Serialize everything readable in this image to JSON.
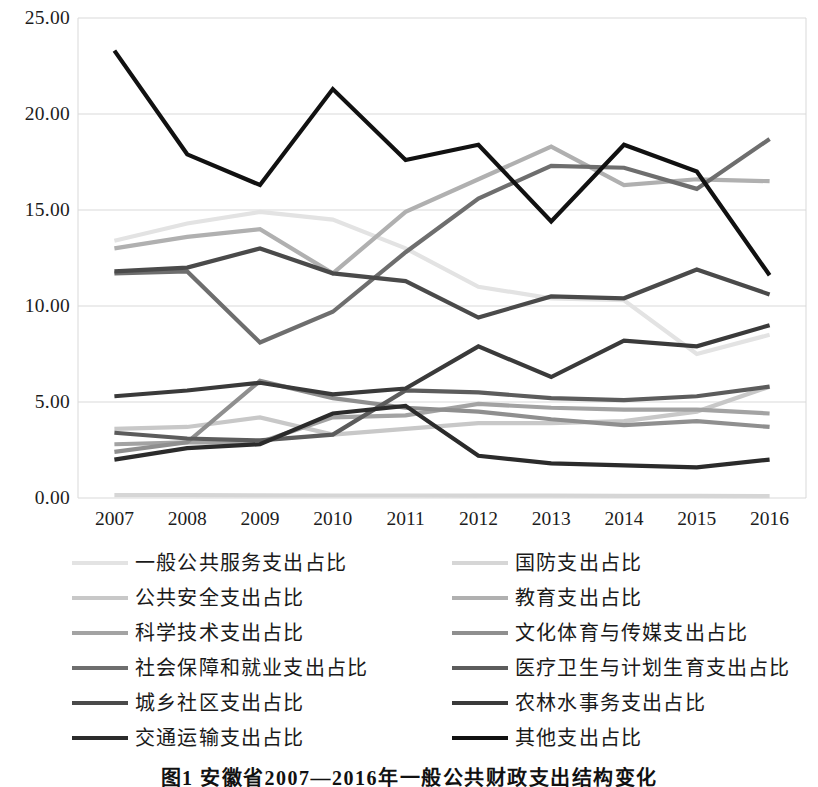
{
  "chart_data": {
    "type": "line",
    "title": "",
    "xlabel": "",
    "ylabel": "",
    "ylim": [
      0,
      25
    ],
    "ytick_labels": [
      "0.00",
      "5.00",
      "10.00",
      "15.00",
      "20.00",
      "25.00"
    ],
    "ytick_values": [
      0,
      5,
      10,
      15,
      20,
      25
    ],
    "grid": true,
    "legend_position": "bottom",
    "categories": [
      "2007",
      "2008",
      "2009",
      "2010",
      "2011",
      "2012",
      "2013",
      "2014",
      "2015",
      "2016"
    ],
    "series": [
      {
        "name": "一般公共服务支出占比",
        "color": "#e3e3e3",
        "values": [
          13.4,
          14.3,
          14.9,
          14.5,
          13.0,
          11.0,
          10.4,
          10.3,
          7.5,
          8.5
        ]
      },
      {
        "name": "国防支出占比",
        "color": "#d6d6d6",
        "values": [
          0.15,
          0.15,
          0.14,
          0.13,
          0.13,
          0.12,
          0.12,
          0.11,
          0.11,
          0.1
        ]
      },
      {
        "name": "公共安全支出占比",
        "color": "#c8c8c8",
        "values": [
          3.6,
          3.7,
          4.2,
          3.3,
          3.6,
          3.9,
          3.9,
          4.0,
          4.5,
          5.8
        ]
      },
      {
        "name": "教育支出占比",
        "color": "#b0b0b0",
        "values": [
          13.0,
          13.6,
          14.0,
          11.7,
          14.9,
          16.6,
          18.3,
          16.3,
          16.6,
          16.5
        ]
      },
      {
        "name": "科学技术支出占比",
        "color": "#a3a3a3",
        "values": [
          2.8,
          2.9,
          2.9,
          4.2,
          4.3,
          4.9,
          4.7,
          4.6,
          4.6,
          4.4
        ]
      },
      {
        "name": "文化体育与传媒支出占比",
        "color": "#8f8f8f",
        "values": [
          2.4,
          2.9,
          6.1,
          5.2,
          4.7,
          4.5,
          4.1,
          3.8,
          4.0,
          3.7
        ]
      },
      {
        "name": "社会保障和就业支出占比",
        "color": "#6e6e6e",
        "values": [
          11.7,
          11.8,
          8.1,
          9.7,
          12.8,
          15.6,
          17.3,
          17.2,
          16.1,
          18.7
        ]
      },
      {
        "name": "医疗卫生与计划生育支出占比",
        "color": "#5c5c5c",
        "values": [
          3.4,
          3.1,
          3.0,
          3.3,
          5.6,
          5.5,
          5.2,
          5.1,
          5.3,
          5.8
        ]
      },
      {
        "name": "城乡社区支出占比",
        "color": "#4a4a4a",
        "values": [
          11.8,
          12.0,
          13.0,
          11.7,
          11.3,
          9.4,
          10.5,
          10.4,
          11.9,
          10.6
        ]
      },
      {
        "name": "农林水事务支出占比",
        "color": "#3a3a3a",
        "values": [
          5.3,
          5.6,
          6.0,
          5.4,
          5.7,
          7.9,
          6.3,
          8.2,
          7.9,
          9.0
        ]
      },
      {
        "name": "交通运输支出占比",
        "color": "#2b2b2b",
        "values": [
          2.0,
          2.6,
          2.8,
          4.4,
          4.8,
          2.2,
          1.8,
          1.7,
          1.6,
          2.0
        ]
      },
      {
        "name": "其他支出占比",
        "color": "#111111",
        "values": [
          23.3,
          17.9,
          16.3,
          21.3,
          17.6,
          18.4,
          14.4,
          18.4,
          17.0,
          11.6
        ]
      }
    ]
  },
  "legend": {
    "left_column": [
      "一般公共服务支出占比",
      "公共安全支出占比",
      "科学技术支出占比",
      "社会保障和就业支出占比",
      "城乡社区支出占比",
      "交通运输支出占比"
    ],
    "right_column": [
      "国防支出占比",
      "教育支出占比",
      "文化体育与传媒支出占比",
      "医疗卫生与计划生育支出占比",
      "农林水事务支出占比",
      "其他支出占比"
    ]
  },
  "caption": {
    "text": "图1 安徽省2007—2016年一般公共财政支出结构变化"
  }
}
